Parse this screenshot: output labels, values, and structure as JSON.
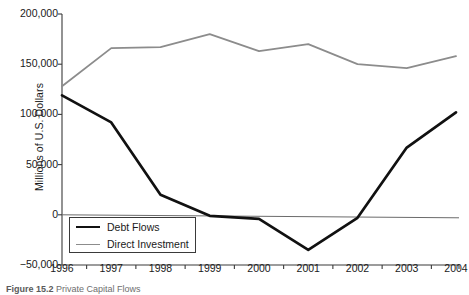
{
  "chart_data": {
    "type": "line",
    "title": "",
    "xlabel": "",
    "ylabel": "Millions of U.S. Dollars",
    "categories": [
      "1996",
      "1997",
      "1998",
      "1999",
      "2000",
      "2001",
      "2002",
      "2003",
      "2004"
    ],
    "x": [
      1996,
      1997,
      1998,
      1999,
      2000,
      2001,
      2002,
      2003,
      2004
    ],
    "series": [
      {
        "name": "Debt Flows",
        "color": "#111111",
        "values": [
          119000,
          92000,
          20000,
          -1000,
          -4000,
          -35000,
          -3000,
          67000,
          102000
        ]
      },
      {
        "name": "Direct Investment",
        "color": "#8c8c8c",
        "values": [
          128000,
          166000,
          167000,
          180000,
          163000,
          170000,
          150000,
          146000,
          158000
        ]
      }
    ],
    "ylim": [
      -50000,
      200000
    ],
    "yticks": [
      -50000,
      0,
      50000,
      100000,
      150000,
      200000
    ],
    "ytick_labels": [
      "−50,000",
      "0",
      "50,000",
      "100,000",
      "150,000",
      "200,000"
    ],
    "xtick_labels": [
      "1996",
      "1997",
      "1998",
      "1999",
      "2000",
      "2001",
      "2002",
      "2003",
      "2004"
    ],
    "grid": false,
    "legend_position": "lower-left",
    "zero_line": true
  },
  "legend": {
    "items": [
      {
        "label": "Debt Flows"
      },
      {
        "label": "Direct Investment"
      }
    ]
  },
  "caption": {
    "figure_number": "Figure 15.2",
    "text": "Private Capital Flows"
  }
}
